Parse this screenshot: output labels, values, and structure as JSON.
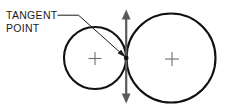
{
  "diagram": {
    "title": "Tangent Point",
    "background_color": "#ffffff",
    "width": 231,
    "height": 110,
    "annotation": {
      "label_line_1": "TANGENT",
      "label_line_2": "POINT",
      "label_color": "#1a1a1a",
      "leader_color": "#1a1a1a"
    },
    "shapes": {
      "left_circle": {
        "name": "small circle",
        "cx": 95,
        "cy": 58,
        "r": 31,
        "stroke_color": "#111111",
        "stroke_width": 2.1,
        "center_mark": "plus"
      },
      "right_circle": {
        "name": "large circle",
        "cx": 171,
        "cy": 58,
        "r": 44.5,
        "stroke_color": "#111111",
        "stroke_width": 2.1,
        "center_mark": "plus"
      },
      "tangent_axis": {
        "name": "common tangent line",
        "x": 126.2,
        "y_top": 10,
        "y_bottom": 103,
        "color": "#5a5a5a",
        "arrowheads": "both"
      },
      "tangent_point": {
        "x": 126.2,
        "y": 58,
        "color": "#111111"
      }
    }
  }
}
